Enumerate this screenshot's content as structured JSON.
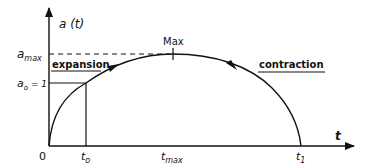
{
  "diagram": {
    "y_axis": {
      "label": "a (t)"
    },
    "x_axis": {
      "label": "t"
    },
    "y_ticks": {
      "a_max": {
        "base": "a",
        "sub": "max"
      },
      "a_o": {
        "base": "a",
        "sub": "o",
        "suffix": " = 1"
      }
    },
    "x_ticks": {
      "origin": "0",
      "t_o": {
        "base": "t",
        "sub": "o"
      },
      "t_max": {
        "base": "t",
        "sub": "max"
      },
      "t_1": {
        "base": "t",
        "sub": "1"
      }
    },
    "annotations": {
      "peak": "Max",
      "phase_1": "expansion",
      "phase_2": "contraction"
    },
    "colors": {
      "ink": "#111111",
      "background": "#ffffff"
    }
  }
}
